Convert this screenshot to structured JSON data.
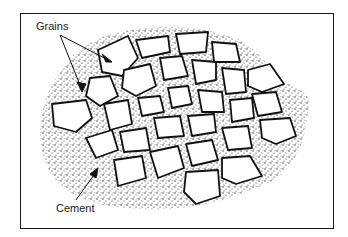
{
  "diagram": {
    "labels": {
      "grains": "Grains",
      "cement": "Cement"
    },
    "colors": {
      "line": "#111111",
      "grain_fill": "#ffffff",
      "stipple": "#222222",
      "background": "#ffffff"
    }
  }
}
